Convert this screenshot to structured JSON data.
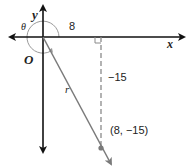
{
  "diagram": {
    "axes": {
      "x_label": "x",
      "y_label": "y",
      "origin_label": "O"
    },
    "angle_label": "θ",
    "horizontal_leg_label": "8",
    "vertical_leg_label": "−15",
    "radius_label": "r",
    "point_label": "(8, −15)",
    "point": {
      "x": 8,
      "y": -15
    },
    "colors": {
      "axis": "#111111",
      "ray": "#7a7a7a",
      "dashed": "#8a8a8a",
      "arc": "#9a9a9a",
      "text": "#222222"
    }
  }
}
